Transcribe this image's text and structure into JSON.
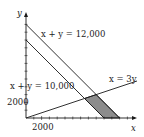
{
  "diagram": {
    "type": "linear-inequality-region",
    "axes": {
      "x_label": "x",
      "y_label": "y",
      "x_tick_label": "2000",
      "y_tick_label": "2000",
      "units_per_tick": 1000
    },
    "lines": [
      {
        "label": "x + y = 12,000",
        "equation": "x + y = 12000"
      },
      {
        "label": "x + y = 10,000",
        "equation": "x + y = 10000"
      },
      {
        "label": "x = 3y",
        "equation": "x = 3y"
      }
    ],
    "shaded_region": {
      "description": "Region between x + y = 10,000 and x + y = 12,000, below x = 3y, above x-axis",
      "vertices": [
        [
          7500,
          2500
        ],
        [
          9000,
          3000
        ],
        [
          12000,
          0
        ],
        [
          10000,
          0
        ]
      ],
      "fill": "#8c8c8c"
    },
    "colors": {
      "line": "#1a1a1a",
      "shade": "#8c8c8c",
      "background": "#ffffff"
    }
  }
}
